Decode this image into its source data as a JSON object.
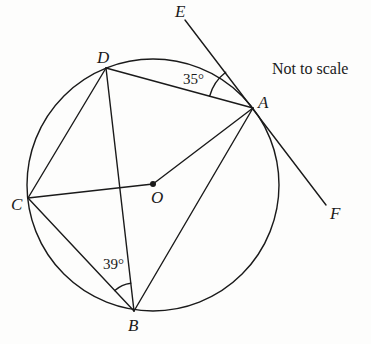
{
  "diagram": {
    "note": "Not to scale",
    "colors": {
      "stroke": "#1a1a1a",
      "background": "#fdfdfc"
    },
    "circle": {
      "center": "O",
      "cx": 153,
      "cy": 185,
      "r": 126
    },
    "points": {
      "A": {
        "label": "A",
        "x": 253,
        "y": 108
      },
      "B": {
        "label": "B",
        "x": 134,
        "y": 311
      },
      "C": {
        "label": "C",
        "x": 28,
        "y": 198
      },
      "D": {
        "label": "D",
        "x": 106,
        "y": 68
      },
      "O": {
        "label": "O",
        "x": 153,
        "y": 184
      },
      "E": {
        "label": "E",
        "x": 185,
        "y": 20
      },
      "F": {
        "label": "F",
        "x": 326,
        "y": 205
      }
    },
    "segments": [
      "DA",
      "DC",
      "DB",
      "CO",
      "OA",
      "CB",
      "AB",
      "EF"
    ],
    "tangent": {
      "line": "EF",
      "touches_at": "A"
    },
    "angles": [
      {
        "name": "angle-DAE",
        "vertex": "A",
        "between": [
          "D",
          "E"
        ],
        "label": "35°"
      },
      {
        "name": "angle-CBD",
        "vertex": "B",
        "between": [
          "C",
          "D"
        ],
        "label": "39°"
      }
    ]
  }
}
